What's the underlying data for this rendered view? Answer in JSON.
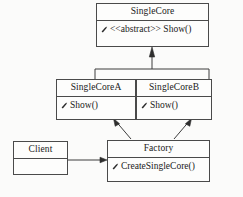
{
  "diagram": {
    "type": "uml-class-diagram",
    "background_color": "#fbfbfa",
    "line_color": "#3c3c3c",
    "box_fill": "#fdfdfc"
  },
  "classes": {
    "single_core": {
      "name": "SingleCore",
      "stereotype_method": "<<abstract>> Show()",
      "method_marker": "method-marker-icon"
    },
    "single_core_a": {
      "name": "SingleCoreA",
      "method": "Show()",
      "method_marker": "method-marker-icon"
    },
    "single_core_b": {
      "name": "SingleCoreB",
      "method": "Show()",
      "method_marker": "method-marker-icon"
    },
    "client": {
      "name": "Client",
      "method": ""
    },
    "factory": {
      "name": "Factory",
      "method": "CreateSingleCore()",
      "method_marker": "method-marker-icon"
    }
  },
  "relations": [
    {
      "from": "SingleCoreA",
      "to": "SingleCore",
      "kind": "generalization"
    },
    {
      "from": "SingleCoreB",
      "to": "SingleCore",
      "kind": "generalization"
    },
    {
      "from": "Factory",
      "to": "SingleCoreA",
      "kind": "dependency"
    },
    {
      "from": "Factory",
      "to": "SingleCoreB",
      "kind": "dependency"
    },
    {
      "from": "Client",
      "to": "Factory",
      "kind": "association"
    }
  ]
}
